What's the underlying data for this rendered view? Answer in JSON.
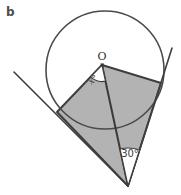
{
  "figure_label": "b",
  "diagram_type": "circle-tangent-geometry",
  "labels": {
    "center_point": "O",
    "center_angle": "x°",
    "external_angle": "30°"
  },
  "colors": {
    "background": "#ffffff",
    "shaded_region": "#b3b3b3",
    "line_dark": "#3e3e3e"
  }
}
